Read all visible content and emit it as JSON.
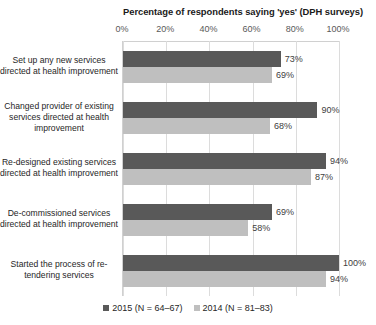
{
  "chart_data": {
    "type": "bar",
    "orientation": "horizontal",
    "title": "Percentage of respondents saying 'yes' (DPH surveys)",
    "xlabel": "",
    "ylabel": "",
    "xlim": [
      0,
      100
    ],
    "xticks": [
      "0%",
      "20%",
      "40%",
      "60%",
      "80%",
      "100%"
    ],
    "xtick_values": [
      0,
      20,
      40,
      60,
      80,
      100
    ],
    "grid": true,
    "legend_position": "bottom",
    "categories": [
      "Set up any new services directed at health improvement",
      "Changed provider of existing services directed at health improvement",
      "Re-designed existing services directed at health improvement",
      "De-commissioned services directed at health improvement",
      "Started the process of re-tendering services"
    ],
    "series": [
      {
        "name": "2015 (N = 64–67)",
        "color": "#595959",
        "values": [
          73,
          90,
          94,
          69,
          100
        ],
        "labels": [
          "73%",
          "90%",
          "94%",
          "69%",
          "100%"
        ]
      },
      {
        "name": "2014 (N = 81–83)",
        "color": "#bfbfbf",
        "values": [
          69,
          68,
          87,
          58,
          94
        ],
        "labels": [
          "69%",
          "68%",
          "87%",
          "58%",
          "94%"
        ]
      }
    ]
  },
  "colors": {
    "series_2015": "#595959",
    "series_2014": "#bfbfbf",
    "gridline": "#dcdcdc",
    "text": "#262626",
    "background": "#ffffff"
  }
}
